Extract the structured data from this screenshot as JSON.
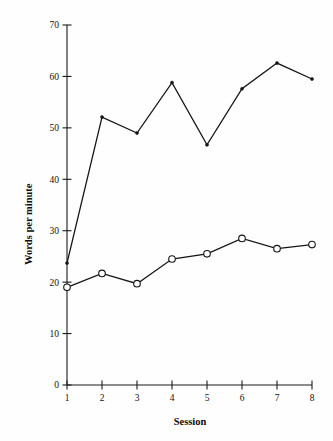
{
  "chart_data": {
    "type": "line",
    "title": "",
    "xlabel": "Session",
    "ylabel": "Words per minute",
    "x": [
      1,
      2,
      3,
      4,
      5,
      6,
      7,
      8
    ],
    "categories": [
      "1",
      "2",
      "3",
      "4",
      "5",
      "6",
      "7",
      "8"
    ],
    "xlim": [
      1,
      8
    ],
    "ylim": [
      0,
      70
    ],
    "yticks": [
      0,
      10,
      20,
      30,
      40,
      50,
      60,
      70
    ],
    "ytick_labels": [
      "0",
      "10",
      "20",
      "30",
      "40",
      "50",
      "60",
      "70"
    ],
    "xticks": [
      1,
      2,
      3,
      4,
      5,
      6,
      7,
      8
    ],
    "xtick_labels": [
      "1",
      "2",
      "3",
      "4",
      "5",
      "6",
      "7",
      "8"
    ],
    "grid": false,
    "legend": false,
    "legend_position": "none",
    "series": [
      {
        "name": "upper-series",
        "marker": "filled-dot",
        "color": "#151515",
        "values": [
          23.7,
          52.1,
          49.0,
          58.8,
          46.7,
          57.6,
          62.6,
          59.5
        ]
      },
      {
        "name": "lower-series",
        "marker": "open-circle",
        "color": "#151515",
        "values": [
          19.0,
          21.7,
          19.7,
          24.5,
          25.5,
          28.5,
          26.5,
          27.3
        ]
      }
    ]
  },
  "labels": {
    "ylabel_text": "Words per minute",
    "xlabel_text": "Session"
  }
}
